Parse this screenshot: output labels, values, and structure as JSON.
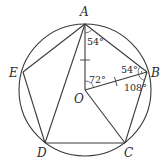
{
  "diagram": {
    "type": "geometry",
    "circle": {
      "center": [
        85,
        90
      ],
      "radius": 66
    },
    "points": {
      "A": {
        "label": "A",
        "xy": [
          85,
          24
        ]
      },
      "B": {
        "label": "B",
        "xy": [
          147,
          72
        ]
      },
      "C": {
        "label": "C",
        "xy": [
          125,
          143
        ]
      },
      "D": {
        "label": "D",
        "xy": [
          45,
          143
        ]
      },
      "E": {
        "label": "E",
        "xy": [
          23,
          72
        ]
      },
      "O": {
        "label": "O",
        "xy": [
          85,
          90
        ]
      }
    },
    "segments": [
      "AB",
      "BC",
      "CD",
      "DE",
      "EA",
      "AD",
      "AO",
      "OB",
      "OC"
    ],
    "angles": {
      "OAB": {
        "label": "54°"
      },
      "AOB": {
        "label": "72°"
      },
      "ABO": {
        "label": "54°"
      },
      "OBC": {
        "label": "108°"
      }
    },
    "equal_ticks": [
      "OA",
      "OB"
    ]
  }
}
